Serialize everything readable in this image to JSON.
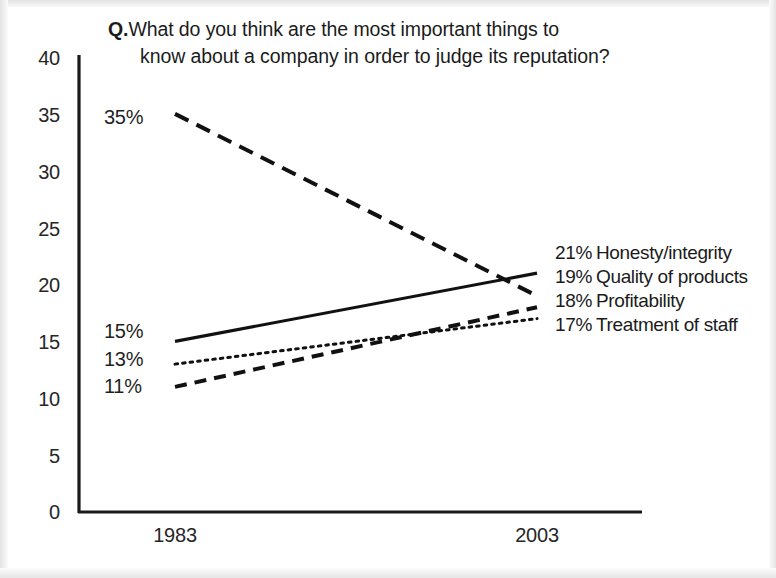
{
  "chart_data": {
    "type": "line",
    "title_prefix": "Q.",
    "title_line1": "What do you think are the most important things to",
    "title_line2": "know about a company in order to judge its reputation?",
    "xlabel": "",
    "ylabel": "",
    "x": [
      "1983",
      "2003"
    ],
    "categories": [
      "1983",
      "2003"
    ],
    "ylim": [
      0,
      40
    ],
    "yticks": [
      "0",
      "5",
      "10",
      "15",
      "20",
      "25",
      "30",
      "35",
      "40"
    ],
    "ytick_values": [
      0,
      5,
      10,
      15,
      20,
      25,
      30,
      35,
      40
    ],
    "grid": false,
    "legend": "inline-endpoint-labels",
    "series": [
      {
        "name": "Honesty/integrity",
        "values": [
          15,
          21
        ],
        "style": "solid",
        "start_label": "15%",
        "end_label": "21%",
        "end_text": "Honesty/integrity",
        "color": "#111111"
      },
      {
        "name": "Quality of products",
        "values": [
          35,
          19
        ],
        "style": "long-dash",
        "start_label": "35%",
        "end_label": "19%",
        "end_text": "Quality of products",
        "color": "#111111"
      },
      {
        "name": "Profitability",
        "values": [
          11,
          18
        ],
        "style": "dash",
        "start_label": "11%",
        "end_label": "18%",
        "end_text": "Profitability",
        "color": "#111111"
      },
      {
        "name": "Treatment of staff",
        "values": [
          13,
          17
        ],
        "style": "dotted",
        "start_label": "13%",
        "end_label": "17%",
        "end_text": "Treatment of staff",
        "color": "#111111"
      }
    ]
  }
}
